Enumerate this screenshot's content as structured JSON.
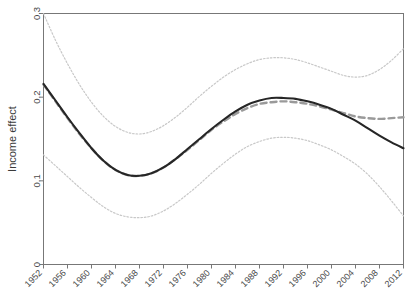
{
  "chart_data": {
    "type": "line",
    "title": "",
    "xlabel": "",
    "ylabel": "Income effect",
    "xlim": [
      1952,
      2012
    ],
    "ylim": [
      0,
      0.3
    ],
    "grid": false,
    "legend": "none",
    "xticks": [
      1952,
      1956,
      1960,
      1964,
      1968,
      1972,
      1976,
      1980,
      1984,
      1988,
      1992,
      1996,
      2000,
      2004,
      2008,
      2012
    ],
    "xticklabels": [
      "1952",
      "1956",
      "1960",
      "1964",
      "1968",
      "1972",
      "1976",
      "1980",
      "1984",
      "1988",
      "1992",
      "1996",
      "2000",
      "2004",
      "2008",
      "2012"
    ],
    "yticks": [
      0,
      0.1,
      0.2,
      0.3
    ],
    "yticklabels": [
      "0",
      "0.1",
      "0.2",
      "0.3"
    ],
    "series": [
      {
        "name": "estimate-solid",
        "style": "solid",
        "color": "#262626",
        "width": 2.1,
        "x": [
          1952,
          1954,
          1956,
          1958,
          1960,
          1962,
          1964,
          1966,
          1968,
          1970,
          1972,
          1974,
          1976,
          1978,
          1980,
          1982,
          1984,
          1986,
          1988,
          1990,
          1992,
          1994,
          1996,
          1998,
          2000,
          2002,
          2004,
          2006,
          2008,
          2010,
          2012
        ],
        "values": [
          0.216,
          0.196,
          0.176,
          0.157,
          0.139,
          0.124,
          0.113,
          0.107,
          0.106,
          0.109,
          0.116,
          0.126,
          0.138,
          0.15,
          0.162,
          0.173,
          0.183,
          0.191,
          0.196,
          0.199,
          0.199,
          0.198,
          0.195,
          0.191,
          0.186,
          0.179,
          0.172,
          0.163,
          0.154,
          0.146,
          0.139
        ]
      },
      {
        "name": "estimate-dashed",
        "style": "dashed",
        "color": "#9a9a9a",
        "width": 2.4,
        "x": [
          1952,
          1954,
          1956,
          1958,
          1960,
          1962,
          1964,
          1966,
          1968,
          1970,
          1972,
          1974,
          1976,
          1978,
          1980,
          1982,
          1984,
          1986,
          1988,
          1990,
          1992,
          1994,
          1996,
          1998,
          2000,
          2002,
          2004,
          2006,
          2008,
          2010,
          2012
        ],
        "values": [
          0.215,
          0.195,
          0.175,
          0.156,
          0.139,
          0.124,
          0.113,
          0.107,
          0.106,
          0.109,
          0.116,
          0.126,
          0.137,
          0.149,
          0.161,
          0.171,
          0.18,
          0.187,
          0.192,
          0.194,
          0.195,
          0.194,
          0.192,
          0.189,
          0.185,
          0.181,
          0.177,
          0.175,
          0.174,
          0.175,
          0.176
        ]
      },
      {
        "name": "upper-confidence-band",
        "style": "dotted",
        "color": "#c8c8c8",
        "width": 1.2,
        "x": [
          1952,
          1954,
          1956,
          1958,
          1960,
          1962,
          1964,
          1966,
          1968,
          1970,
          1972,
          1974,
          1976,
          1978,
          1980,
          1982,
          1984,
          1986,
          1988,
          1990,
          1992,
          1994,
          1996,
          1998,
          2000,
          2002,
          2004,
          2006,
          2008,
          2010,
          2012
        ],
        "values": [
          0.3,
          0.268,
          0.24,
          0.215,
          0.194,
          0.177,
          0.165,
          0.158,
          0.156,
          0.159,
          0.166,
          0.176,
          0.188,
          0.201,
          0.213,
          0.224,
          0.233,
          0.24,
          0.245,
          0.247,
          0.247,
          0.245,
          0.241,
          0.236,
          0.231,
          0.226,
          0.224,
          0.226,
          0.233,
          0.244,
          0.258
        ]
      },
      {
        "name": "lower-confidence-band",
        "style": "dotted",
        "color": "#c8c8c8",
        "width": 1.2,
        "x": [
          1952,
          1954,
          1956,
          1958,
          1960,
          1962,
          1964,
          1966,
          1968,
          1970,
          1972,
          1974,
          1976,
          1978,
          1980,
          1982,
          1984,
          1986,
          1988,
          1990,
          1992,
          1994,
          1996,
          1998,
          2000,
          2002,
          2004,
          2006,
          2008,
          2010,
          2012
        ],
        "values": [
          0.131,
          0.118,
          0.105,
          0.092,
          0.08,
          0.069,
          0.061,
          0.057,
          0.056,
          0.058,
          0.064,
          0.073,
          0.084,
          0.096,
          0.109,
          0.121,
          0.132,
          0.141,
          0.147,
          0.151,
          0.152,
          0.151,
          0.148,
          0.143,
          0.137,
          0.129,
          0.12,
          0.108,
          0.093,
          0.076,
          0.058
        ]
      }
    ]
  },
  "axes": {
    "ylabel": "Income effect"
  }
}
